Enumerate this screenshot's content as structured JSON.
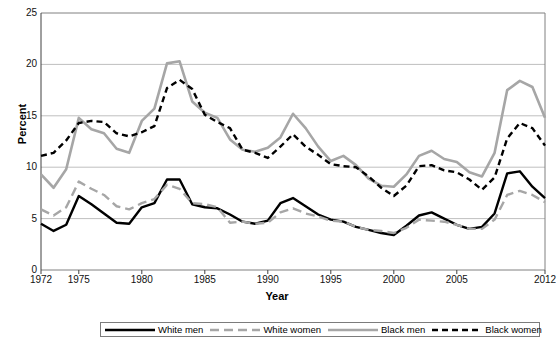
{
  "chart_data": {
    "type": "line",
    "title": "",
    "xlabel": "Year",
    "ylabel": "Percent",
    "ylim": [
      0,
      25
    ],
    "xlim": [
      1972,
      2012
    ],
    "yticks": [
      0,
      5,
      10,
      15,
      20,
      25
    ],
    "xticks": [
      1972,
      1975,
      1980,
      1985,
      1990,
      1995,
      2000,
      2005,
      2012
    ],
    "grid": true,
    "legend_position": "bottom",
    "x": [
      1972,
      1973,
      1974,
      1975,
      1976,
      1977,
      1978,
      1979,
      1980,
      1981,
      1982,
      1983,
      1984,
      1985,
      1986,
      1987,
      1988,
      1989,
      1990,
      1991,
      1992,
      1993,
      1994,
      1995,
      1996,
      1997,
      1998,
      1999,
      2000,
      2001,
      2002,
      2003,
      2004,
      2005,
      2006,
      2007,
      2008,
      2009,
      2010,
      2011,
      2012
    ],
    "series": [
      {
        "name": "White men",
        "color": "#000000",
        "style": "solid",
        "width": 2.4,
        "values": [
          4.5,
          3.8,
          4.4,
          7.2,
          6.4,
          5.5,
          4.6,
          4.5,
          6.1,
          6.5,
          8.8,
          8.8,
          6.4,
          6.1,
          6.0,
          5.4,
          4.7,
          4.5,
          4.8,
          6.5,
          7.0,
          6.2,
          5.4,
          4.9,
          4.7,
          4.2,
          3.9,
          3.6,
          3.4,
          4.3,
          5.3,
          5.6,
          5.0,
          4.4,
          4.0,
          4.2,
          5.5,
          9.4,
          9.6,
          8.1,
          7.0
        ]
      },
      {
        "name": "White women",
        "color": "#a6a6a6",
        "style": "dashed",
        "width": 2.4,
        "values": [
          5.9,
          5.3,
          6.1,
          8.6,
          7.9,
          7.3,
          6.2,
          5.9,
          6.5,
          6.9,
          8.3,
          7.9,
          6.5,
          6.4,
          6.1,
          4.6,
          4.7,
          4.5,
          4.6,
          5.6,
          6.0,
          5.5,
          5.2,
          4.8,
          4.7,
          4.2,
          3.9,
          3.8,
          3.6,
          4.1,
          4.9,
          4.8,
          4.7,
          4.4,
          4.0,
          4.0,
          4.9,
          7.3,
          7.7,
          7.3,
          6.6
        ]
      },
      {
        "name": "Black men",
        "color": "#a6a6a6",
        "style": "solid",
        "width": 2.6,
        "values": [
          9.3,
          8.0,
          9.8,
          14.8,
          13.7,
          13.3,
          11.8,
          11.4,
          14.5,
          15.7,
          20.1,
          20.3,
          16.4,
          15.3,
          14.8,
          12.7,
          11.7,
          11.5,
          11.9,
          12.9,
          15.2,
          13.8,
          12.0,
          10.6,
          11.1,
          10.2,
          8.9,
          8.2,
          8.1,
          9.3,
          11.1,
          11.6,
          10.8,
          10.5,
          9.5,
          9.1,
          11.4,
          17.5,
          18.4,
          17.8,
          14.8
        ]
      },
      {
        "name": "Black women",
        "color": "#000000",
        "style": "dotted-dash",
        "width": 2.4,
        "values": [
          11.1,
          11.4,
          12.6,
          14.3,
          14.5,
          14.4,
          13.3,
          13.0,
          13.4,
          14.0,
          17.7,
          18.5,
          17.6,
          15.1,
          14.4,
          13.8,
          11.7,
          11.4,
          10.9,
          12.0,
          13.2,
          12.0,
          11.2,
          10.3,
          10.1,
          10.0,
          9.1,
          8.0,
          7.2,
          8.2,
          10.1,
          10.2,
          9.7,
          9.5,
          8.8,
          7.8,
          9.0,
          12.8,
          14.3,
          13.8,
          12.1
        ]
      }
    ]
  },
  "axis": {
    "y_label": "Percent",
    "x_label": "Year",
    "y_tick_labels": [
      "0",
      "5",
      "10",
      "15",
      "20",
      "25"
    ],
    "x_tick_labels": [
      "1972",
      "1975",
      "1980",
      "1985",
      "1990",
      "1995",
      "2000",
      "2005",
      "2012"
    ]
  },
  "legend": {
    "entries": [
      {
        "label": "White men"
      },
      {
        "label": "White women"
      },
      {
        "label": "Black men"
      },
      {
        "label": "Black women"
      }
    ]
  },
  "colors": {
    "black": "#000000",
    "gray": "#a6a6a6",
    "grid": "#bfbfbf",
    "axis": "#808080"
  }
}
